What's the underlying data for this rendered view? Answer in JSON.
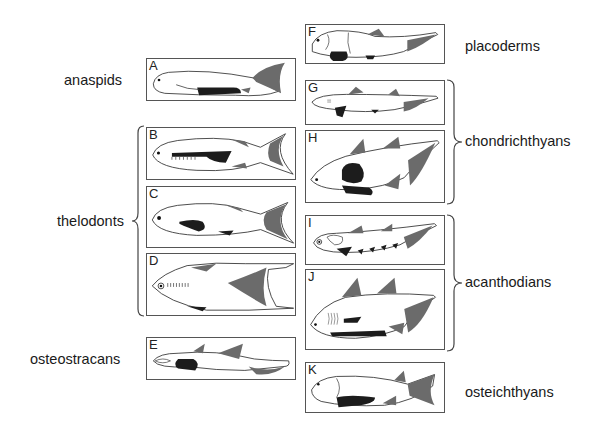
{
  "diagram": {
    "type": "early-vertebrate-fish-body-plans",
    "colors": {
      "outline": "#333333",
      "fin_gray": "#6b6b6b",
      "paired_black": "#1c1c1c",
      "box_border": "#555555"
    },
    "groups": [
      {
        "id": "anaspids",
        "label": "anaspids",
        "panels": [
          "A"
        ]
      },
      {
        "id": "thelodonts",
        "label": "thelodonts",
        "panels": [
          "B",
          "C",
          "D"
        ]
      },
      {
        "id": "osteostracans",
        "label": "osteostracans",
        "panels": [
          "E"
        ]
      },
      {
        "id": "placoderms",
        "label": "placoderms",
        "panels": [
          "F"
        ]
      },
      {
        "id": "chondrichthyans",
        "label": "chondrichthyans",
        "panels": [
          "G",
          "H"
        ]
      },
      {
        "id": "acanthodians",
        "label": "acanthodians",
        "panels": [
          "I",
          "J"
        ]
      },
      {
        "id": "osteichthyans",
        "label": "osteichthyans",
        "panels": [
          "K"
        ]
      }
    ],
    "panels": {
      "A": {
        "letter": "A"
      },
      "B": {
        "letter": "B"
      },
      "C": {
        "letter": "C"
      },
      "D": {
        "letter": "D"
      },
      "E": {
        "letter": "E"
      },
      "F": {
        "letter": "F"
      },
      "G": {
        "letter": "G"
      },
      "H": {
        "letter": "H"
      },
      "I": {
        "letter": "I"
      },
      "J": {
        "letter": "J"
      },
      "K": {
        "letter": "K"
      }
    }
  }
}
